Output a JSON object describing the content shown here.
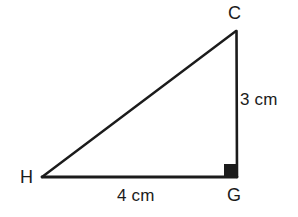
{
  "figure": {
    "kind": "right-triangle-geometry-diagram",
    "background_color": "#ffffff",
    "stroke_color": "#1b1b1b",
    "stroke_width": 2.6,
    "vertices": {
      "C": {
        "label": "C",
        "x": 236,
        "y": 31
      },
      "G": {
        "label": "G",
        "x": 237,
        "y": 177
      },
      "H": {
        "label": "H",
        "x": 42,
        "y": 177
      }
    },
    "right_angle": {
      "at_vertex": "G",
      "marker": "filled-square",
      "size": 13,
      "fill_color": "#1b1b1b"
    },
    "sides": [
      {
        "name": "CG",
        "from": "C",
        "to": "G",
        "length_label": "3 cm",
        "orientation": "vertical"
      },
      {
        "name": "HG",
        "from": "H",
        "to": "G",
        "length_label": "4 cm",
        "orientation": "horizontal"
      },
      {
        "name": "HC",
        "from": "H",
        "to": "C",
        "length_label": "",
        "orientation": "hypotenuse"
      }
    ]
  },
  "labels": {
    "vertex_c": "C",
    "vertex_g": "G",
    "vertex_h": "H",
    "leg_vertical": "3 cm",
    "leg_horizontal": "4 cm"
  }
}
